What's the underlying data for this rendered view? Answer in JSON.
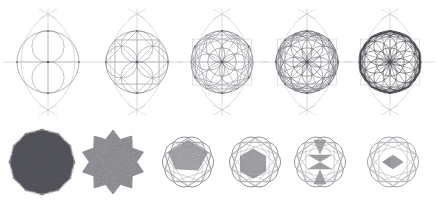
{
  "document": {
    "title": "Geometric Construction Sequence",
    "background_color": "#ffffff",
    "width": 438,
    "height": 200
  },
  "palette": {
    "stroke_light": "#b9b9be",
    "stroke_mid": "#8d8d95",
    "stroke_dark": "#5b5b63",
    "stroke_darkest": "#3a3a40",
    "fill_dark": "#585860",
    "fill_mid": "#9a9aa0",
    "fill_light": "#bdbdc2",
    "fill_none": "none"
  },
  "chart_data": {
    "type": "diagram",
    "rows": 2,
    "top_row_count": 5,
    "bottom_row_count": 6
  },
  "top_row": {
    "label": "construction-steps",
    "center_y": 62,
    "figures": [
      {
        "id": "construction-step-1",
        "label": "Step 1 - Vesica and base circle",
        "cx": 48,
        "cy": 62,
        "r": 31,
        "petals": 2,
        "rays": 4,
        "inner_circles": 2,
        "stroke": "#9a9aa0",
        "density": 1
      },
      {
        "id": "construction-step-2",
        "label": "Step 2 - Four lobes added",
        "cx": 137,
        "cy": 62,
        "r": 31,
        "petals": 4,
        "rays": 8,
        "inner_circles": 4,
        "stroke": "#8d8d95",
        "density": 2
      },
      {
        "id": "construction-step-3",
        "label": "Step 3 - Six lobes and star chords",
        "cx": 222,
        "cy": 62,
        "r": 31,
        "petals": 6,
        "rays": 12,
        "inner_circles": 6,
        "stroke": "#7e7e86",
        "density": 3
      },
      {
        "id": "construction-step-4",
        "label": "Step 4 - Eight lobes rosette",
        "cx": 307,
        "cy": 62,
        "r": 31,
        "petals": 8,
        "rays": 16,
        "inner_circles": 8,
        "stroke": "#6c6c74",
        "density": 4
      },
      {
        "id": "construction-step-5",
        "label": "Step 5 - Completed decagonal rosette",
        "cx": 390,
        "cy": 62,
        "r": 31,
        "petals": 10,
        "rays": 20,
        "inner_circles": 10,
        "stroke": "#4b4b52",
        "density": 5
      }
    ]
  },
  "bottom_row": {
    "label": "resulting-tilings",
    "center_y": 162,
    "figures": [
      {
        "id": "tiling-1",
        "label": "Filled decagon",
        "cx": 42,
        "cy": 162,
        "r": 33,
        "points": 12,
        "star_depth": 0.93,
        "fill": "#585860",
        "fill_opacity": 1,
        "texture": true,
        "stroke": "#78787f",
        "inner_chords": 0
      },
      {
        "id": "tiling-2",
        "label": "Filled 10-point star rosette",
        "cx": 113,
        "cy": 162,
        "r": 32,
        "points": 10,
        "star_depth": 0.74,
        "fill": "#9a9aa0",
        "fill_opacity": 1,
        "texture": true,
        "stroke": "#9a9aa0",
        "inner_chords": 0
      },
      {
        "id": "tiling-3",
        "label": "Outlined star with single shaded cell",
        "cx": 188,
        "cy": 162,
        "r": 32,
        "points": 10,
        "star_depth": 0.76,
        "fill": "none",
        "fill_opacity": 0,
        "texture": false,
        "stroke": "#7b7b83",
        "inner_chords": 5,
        "shaded_cells": 1
      },
      {
        "id": "tiling-4",
        "label": "Star with hexagonal shaded core",
        "cx": 255,
        "cy": 162,
        "r": 32,
        "points": 10,
        "star_depth": 0.76,
        "fill": "none",
        "fill_opacity": 0,
        "texture": false,
        "stroke": "#7b7b83",
        "inner_chords": 8,
        "shaded_cells": 2
      },
      {
        "id": "tiling-5",
        "label": "Star with bowtie shaded core",
        "cx": 320,
        "cy": 162,
        "r": 32,
        "points": 10,
        "star_depth": 0.76,
        "fill": "none",
        "fill_opacity": 0,
        "texture": false,
        "stroke": "#86868e",
        "inner_chords": 10,
        "shaded_cells": 3
      },
      {
        "id": "tiling-6",
        "label": "Star with diamond shaded core",
        "cx": 393,
        "cy": 162,
        "r": 32,
        "points": 10,
        "star_depth": 0.76,
        "fill": "none",
        "fill_opacity": 0,
        "texture": false,
        "stroke": "#94949c",
        "inner_chords": 10,
        "shaded_cells": 2
      }
    ]
  }
}
